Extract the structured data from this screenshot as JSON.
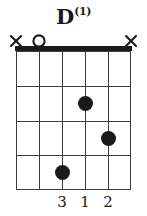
{
  "chord": {
    "title_root": "D",
    "title_superscript": "(1)",
    "instrument": "guitar",
    "strings": 6,
    "frets": 4,
    "nut_shown": true,
    "colors": {
      "ink": "#1a1a1a",
      "grid": "#3a3a3a",
      "background": "#ffffff"
    },
    "string_markers": [
      {
        "string": 1,
        "symbol": "X",
        "name": "muted-string-marker"
      },
      {
        "string": 2,
        "symbol": "O",
        "name": "open-string-marker"
      },
      {
        "string": 3,
        "symbol": "",
        "name": "none"
      },
      {
        "string": 4,
        "symbol": "",
        "name": "none"
      },
      {
        "string": 5,
        "symbol": "",
        "name": "none"
      },
      {
        "string": 6,
        "symbol": "X",
        "name": "muted-string-marker"
      }
    ],
    "dots": [
      {
        "string": 4,
        "fret": 2,
        "finger": "1"
      },
      {
        "string": 5,
        "fret": 3,
        "finger": "2"
      },
      {
        "string": 3,
        "fret": 4,
        "finger": "3"
      }
    ],
    "finger_numbers": [
      {
        "string": 3,
        "label": "3"
      },
      {
        "string": 4,
        "label": "1"
      },
      {
        "string": 5,
        "label": "2"
      }
    ]
  },
  "geometry": {
    "string_x": [
      16,
      39,
      62,
      85,
      108,
      131
    ],
    "fret_y": [
      51,
      86,
      121,
      155,
      190
    ]
  }
}
